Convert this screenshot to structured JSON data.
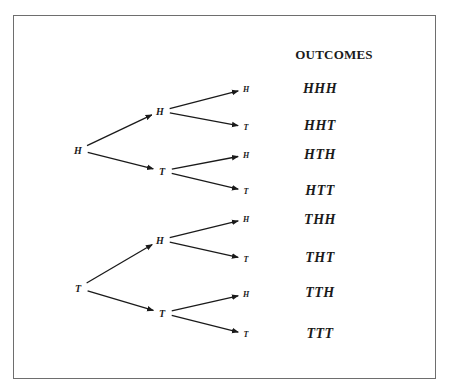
{
  "title": "OUTCOMES",
  "tree": {
    "roots": [
      {
        "label": "H",
        "x": 78,
        "y": 150,
        "children": [
          {
            "label": "H",
            "x": 160,
            "y": 111,
            "children": [
              {
                "label": "H",
                "x": 246,
                "y": 89
              },
              {
                "label": "T",
                "x": 246,
                "y": 127
              }
            ]
          },
          {
            "label": "T",
            "x": 162,
            "y": 171,
            "children": [
              {
                "label": "H",
                "x": 246,
                "y": 155
              },
              {
                "label": "T",
                "x": 246,
                "y": 191
              }
            ]
          }
        ]
      },
      {
        "label": "T",
        "x": 78,
        "y": 288,
        "children": [
          {
            "label": "H",
            "x": 160,
            "y": 240,
            "children": [
              {
                "label": "H",
                "x": 246,
                "y": 219
              },
              {
                "label": "T",
                "x": 246,
                "y": 259
              }
            ]
          },
          {
            "label": "T",
            "x": 162,
            "y": 313,
            "children": [
              {
                "label": "H",
                "x": 246,
                "y": 294
              },
              {
                "label": "T",
                "x": 246,
                "y": 334
              }
            ]
          }
        ]
      }
    ]
  },
  "outcomes": [
    {
      "label": "HHH",
      "y": 89
    },
    {
      "label": "HHT",
      "y": 126
    },
    {
      "label": "HTH",
      "y": 155
    },
    {
      "label": "HTT",
      "y": 191
    },
    {
      "label": "THH",
      "y": 220
    },
    {
      "label": "THT",
      "y": 258
    },
    {
      "label": "TTH",
      "y": 293
    },
    {
      "label": "TTT",
      "y": 334
    }
  ],
  "colors": {
    "line": "#1a1a1a",
    "frame": "#6e6e6e"
  }
}
